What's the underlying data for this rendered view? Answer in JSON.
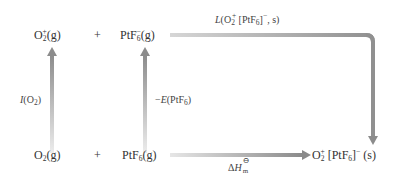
{
  "diagram": {
    "type": "born-haber-cycle",
    "top_row": {
      "species_1": {
        "base": "O",
        "sub": "2",
        "sup": "+",
        "state": "(g)"
      },
      "plus": "+",
      "species_2": {
        "base": "PtF",
        "sub": "6",
        "sup": "−",
        "state": "(g)"
      }
    },
    "bottom_row": {
      "species_1": {
        "base": "O",
        "sub": "2",
        "state": "(g)"
      },
      "plus": "+",
      "species_2": {
        "base": "PtF",
        "sub": "6",
        "state": "(g)"
      },
      "product": {
        "part1": "O",
        "sub1": "2",
        "sup1": "+",
        "part2": " [PtF",
        "sub2": "6",
        "part3": "]",
        "sup2": "−",
        "state": " (s)"
      }
    },
    "labels": {
      "lattice": {
        "func": "L",
        "open": "(O",
        "sub1": "2",
        "sup1": "+",
        "mid": " [PtF",
        "sub2": "6",
        "close": "]",
        "sup2": "−",
        "end": ", s)"
      },
      "ionization": {
        "func": "I",
        "open": "(O",
        "sub": "2",
        "close": ")"
      },
      "electron_affinity": {
        "prefix": "−",
        "func": "E",
        "open": "(PtF",
        "sub": "6",
        "close": ")"
      },
      "enthalpy": {
        "delta": "Δ",
        "sym": "H",
        "sup": "⊖",
        "sub": "m"
      }
    },
    "colors": {
      "arrow_dark": "#8c8c8c",
      "arrow_light": "#e6e6e6",
      "text": "#333333"
    }
  }
}
